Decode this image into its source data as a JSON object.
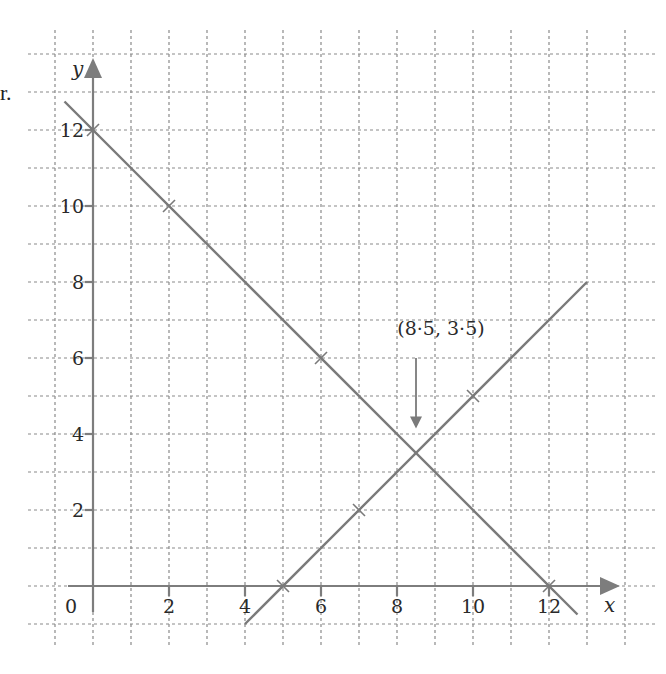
{
  "page_fragment": "r.",
  "chart_data": {
    "type": "line",
    "title": "",
    "xlabel": "x",
    "ylabel": "y",
    "xlim": [
      -1,
      14
    ],
    "ylim": [
      -1,
      14
    ],
    "grid": true,
    "grid_step": 1,
    "x_ticks": [
      0,
      2,
      4,
      6,
      8,
      10,
      12
    ],
    "x_tick_labels": [
      "0",
      "2",
      "4",
      "6",
      "8",
      "10",
      "12"
    ],
    "y_ticks": [
      2,
      4,
      6,
      8,
      10,
      12
    ],
    "y_tick_labels": [
      "2",
      "4",
      "6",
      "8",
      "10",
      "12"
    ],
    "series": [
      {
        "name": "y = 12 - x",
        "line_from": [
          -0.75,
          12.75
        ],
        "line_to": [
          12.75,
          -0.75
        ],
        "marked_points": [
          [
            0,
            12
          ],
          [
            2,
            10
          ],
          [
            6,
            6
          ],
          [
            12,
            0
          ]
        ]
      },
      {
        "name": "y = x - 5",
        "line_from": [
          4,
          -1
        ],
        "line_to": [
          13,
          8
        ],
        "marked_points": [
          [
            5,
            0
          ],
          [
            7,
            2
          ],
          [
            10,
            5
          ]
        ]
      }
    ],
    "annotations": [
      {
        "text": "(8·5, 3·5)",
        "point": [
          8.5,
          3.5
        ],
        "label_position": [
          8.5,
          6.6
        ],
        "arrow_from": [
          8.5,
          6.0
        ],
        "arrow_to": [
          8.5,
          4.2
        ]
      }
    ]
  }
}
